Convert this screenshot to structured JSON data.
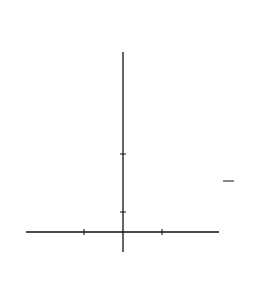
{
  "problem_number": "13.",
  "chart_data": {
    "type": "line",
    "title": "",
    "xlabel": "x",
    "ylabel": "y",
    "x_ticks": [
      {
        "value": -2,
        "label": "−2"
      },
      {
        "value": 2,
        "label": "2"
      }
    ],
    "y_ticks": [
      {
        "value": 1,
        "label": "1"
      },
      {
        "value": 4,
        "label": "4"
      }
    ],
    "xlim": [
      -5,
      5
    ],
    "ylim": [
      0,
      9.2
    ],
    "grid": false,
    "series": [
      {
        "name": "y = x^2",
        "label_lhs": "y",
        "label_eq": "=",
        "label_var": "x",
        "label_exp": "2",
        "style": "solid",
        "coef": 1,
        "x": [
          -3,
          -2,
          -1,
          0,
          1,
          2,
          3
        ],
        "y": [
          9,
          4,
          1,
          0,
          1,
          4,
          9
        ]
      },
      {
        "name": "y = 1/4 x^2",
        "label_lhs": "y",
        "label_eq": "=",
        "label_num": "1",
        "label_den": "4",
        "label_var": "x",
        "label_exp": "2",
        "style": "dashed",
        "coef": 0.25,
        "x": [
          -5,
          -4,
          -2,
          0,
          2,
          4,
          5
        ],
        "y": [
          6.25,
          4,
          1,
          0,
          1,
          4,
          6.25
        ]
      }
    ]
  }
}
